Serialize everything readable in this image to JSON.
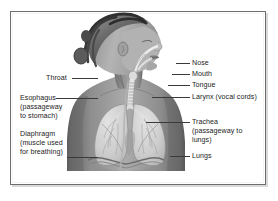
{
  "diagram": {
    "frame_color": "#6e6e6e",
    "text_color": "#232323",
    "leader_color": "#3a3a3a",
    "background": "#ffffff"
  },
  "labels_left": [
    {
      "key": "throat",
      "lines": [
        "Throat"
      ],
      "x": 46,
      "y": 74,
      "leader": {
        "x": 72,
        "y": 78,
        "w": 26
      }
    },
    {
      "key": "esophagus",
      "lines": [
        "Esophagus",
        "(passageway",
        "to stomach)"
      ],
      "x": 20,
      "y": 94,
      "leader": {
        "x": 56,
        "y": 98,
        "w": 42
      }
    },
    {
      "key": "diaphragm",
      "lines": [
        "Diaphragm",
        "(muscle used",
        "for breathing)"
      ],
      "x": 20,
      "y": 130,
      "leader": {
        "x": 67,
        "y": 157,
        "w": 31
      }
    }
  ],
  "labels_right": [
    {
      "key": "nose",
      "lines": [
        "Nose"
      ],
      "x": 192,
      "y": 59,
      "leader": {
        "x": 176,
        "y": 63,
        "w": 14
      }
    },
    {
      "key": "mouth",
      "lines": [
        "Mouth"
      ],
      "x": 192,
      "y": 70,
      "leader": {
        "x": 172,
        "y": 74,
        "w": 18
      }
    },
    {
      "key": "tongue",
      "lines": [
        "Tongue"
      ],
      "x": 192,
      "y": 81,
      "leader": {
        "x": 168,
        "y": 85,
        "w": 22
      }
    },
    {
      "key": "larynx",
      "lines": [
        "Larynx (vocal cords)"
      ],
      "x": 192,
      "y": 93,
      "leader": {
        "x": 152,
        "y": 97,
        "w": 38
      }
    },
    {
      "key": "trachea",
      "lines": [
        "Trachea",
        "(passageway to",
        "lungs)"
      ],
      "x": 192,
      "y": 118,
      "leader": {
        "x": 146,
        "y": 122,
        "w": 44
      }
    },
    {
      "key": "lungs",
      "lines": [
        "Lungs"
      ],
      "x": 192,
      "y": 152,
      "leader": {
        "x": 170,
        "y": 156,
        "w": 20
      }
    }
  ]
}
